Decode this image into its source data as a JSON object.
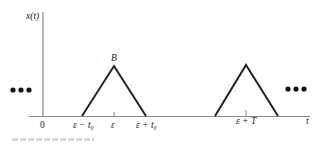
{
  "diagram": {
    "title": "",
    "y_axis_label": "x(t)",
    "x_axis_label": "t",
    "peak_label": "B",
    "ellipsis_left": "•••",
    "ellipsis_right": "•••",
    "ticks": {
      "origin": "0",
      "eps_minus_t0": "ε − t₀",
      "eps": "ε",
      "eps_plus_t0": "ε + t₀",
      "eps_plus_T": "ε + T"
    },
    "pulses": [
      {
        "center": "ε",
        "start": "ε − t₀",
        "end": "ε + t₀",
        "peak": "B"
      },
      {
        "center": "ε + T"
      }
    ],
    "colors": {
      "line": "#222222",
      "axis": "#777777"
    }
  }
}
